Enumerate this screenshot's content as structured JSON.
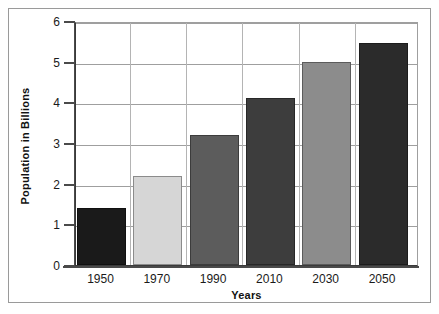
{
  "chart_data": {
    "type": "bar",
    "title": "",
    "xlabel": "Years",
    "ylabel": "Population in Billions",
    "categories": [
      "1950",
      "1970",
      "1990",
      "2010",
      "2030",
      "2050"
    ],
    "values": [
      1.4,
      2.2,
      3.2,
      4.1,
      5.0,
      5.45
    ],
    "ylim": [
      0,
      6
    ],
    "ytick_labels": [
      "0",
      "1",
      "2",
      "3",
      "4",
      "5",
      "6"
    ],
    "ytick_values": [
      0,
      1,
      2,
      3,
      4,
      5,
      6
    ],
    "grid": "horizontal-and-vertical",
    "legend": "none",
    "bar_colors": [
      "#1a1a1a",
      "#d6d6d6",
      "#5c5c5c",
      "#3d3d3d",
      "#8c8c8c",
      "#2b2b2b"
    ],
    "series": [
      {
        "name": "Population",
        "values": [
          1.4,
          2.2,
          3.2,
          4.1,
          5.0,
          5.45
        ]
      }
    ]
  },
  "figure": {
    "frame_color": "#9a9a9a",
    "axis_color": "#4a4a4a",
    "grid_color": "#9f9f9f",
    "background": "#ffffff"
  }
}
